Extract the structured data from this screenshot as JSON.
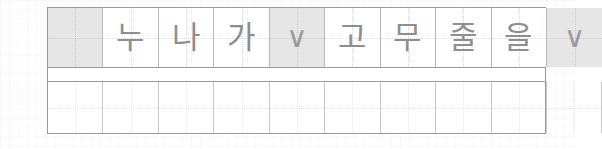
{
  "worksheet": {
    "type": "korean-manuscript-practice-sheet",
    "sentence": "누나가 고무줄을",
    "colors": {
      "cell_border": "#b9b9b9",
      "row_border": "#9a9a9a",
      "shaded_cell_bg": "#e6e6e6",
      "glyph_color": "#8e8e8e",
      "page_bg": "#ffffff"
    },
    "rows": [
      {
        "name": "characters-row",
        "cells": [
          {
            "text": "",
            "shaded": true,
            "kind": "indent-space"
          },
          {
            "text": "누",
            "shaded": false,
            "kind": "syllable"
          },
          {
            "text": "나",
            "shaded": false,
            "kind": "syllable"
          },
          {
            "text": "가",
            "shaded": false,
            "kind": "syllable"
          },
          {
            "text": "∨",
            "shaded": true,
            "kind": "space-mark"
          },
          {
            "text": "고",
            "shaded": false,
            "kind": "syllable"
          },
          {
            "text": "무",
            "shaded": false,
            "kind": "syllable"
          },
          {
            "text": "줄",
            "shaded": false,
            "kind": "syllable"
          },
          {
            "text": "을",
            "shaded": false,
            "kind": "syllable"
          },
          {
            "text": "∨",
            "shaded": true,
            "kind": "space-mark"
          }
        ]
      },
      {
        "name": "spacer-row",
        "cells": [
          {
            "text": "",
            "shaded": false,
            "kind": "blank"
          }
        ]
      },
      {
        "name": "practice-row",
        "cells": [
          {
            "text": "",
            "shaded": false,
            "kind": "blank"
          },
          {
            "text": "",
            "shaded": false,
            "kind": "blank"
          },
          {
            "text": "",
            "shaded": false,
            "kind": "blank"
          },
          {
            "text": "",
            "shaded": false,
            "kind": "blank"
          },
          {
            "text": "",
            "shaded": false,
            "kind": "blank"
          },
          {
            "text": "",
            "shaded": false,
            "kind": "blank"
          },
          {
            "text": "",
            "shaded": false,
            "kind": "blank"
          },
          {
            "text": "",
            "shaded": false,
            "kind": "blank"
          },
          {
            "text": "",
            "shaded": false,
            "kind": "blank"
          },
          {
            "text": "",
            "shaded": false,
            "kind": "blank"
          }
        ]
      }
    ]
  }
}
